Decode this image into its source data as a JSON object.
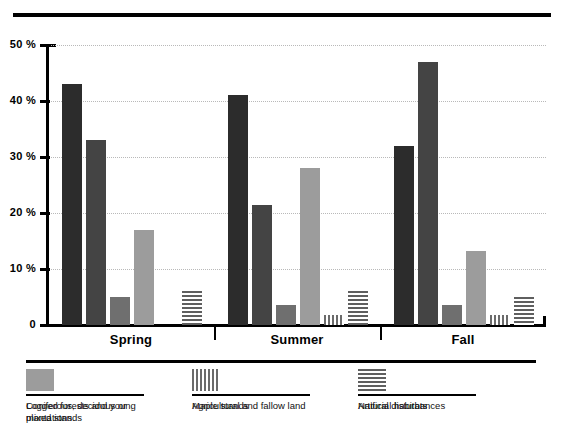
{
  "title": "",
  "chart_data": {
    "type": "bar",
    "title": "",
    "xlabel": "",
    "ylabel": "",
    "ylim": [
      0,
      50
    ],
    "yunit": "%",
    "grid": true,
    "legend_position": "bottom",
    "categories": [
      "Spring",
      "Summer",
      "Fall"
    ],
    "ytick_labels": [
      "0",
      "10 %",
      "20 %",
      "30 %",
      "40 %",
      "50 %"
    ],
    "ytick_values": [
      0,
      10,
      20,
      30,
      40,
      50
    ],
    "series": [
      {
        "name": "Coniferous, decidous or mixed stands",
        "swatch": "solid-very-dark",
        "color": "#2c2c2c",
        "values": [
          43,
          41,
          32
        ]
      },
      {
        "name": "Maple stands",
        "swatch": "solid-dark",
        "color": "#444444",
        "values": [
          33,
          21.5,
          47
        ]
      },
      {
        "name": "Natural disturbances",
        "swatch": "solid-medium-gray",
        "color": "#6f6f6f",
        "values": [
          5,
          3.5,
          3.5
        ]
      },
      {
        "name": "Logged forests and young plantations",
        "swatch": "solid-light-gray",
        "color": "#9c9c9c",
        "values": [
          17,
          28,
          13.3
        ]
      },
      {
        "name": "Agricultural and fallow land",
        "swatch": "vertical-stripes",
        "color": "#6b6b6b",
        "values": [
          0,
          1.8,
          1.8
        ]
      },
      {
        "name": "Artificial habitats",
        "swatch": "horizontal-stripes",
        "color": "#5f5f5f",
        "values": [
          6,
          6,
          5
        ]
      }
    ]
  },
  "legend": {
    "items": [
      {
        "label": "Coniferous, decidous or mixed stands"
      },
      {
        "label": "Maple stands"
      },
      {
        "label": "Natural disturbances"
      },
      {
        "label": "Logged forests and young plantations"
      },
      {
        "label": "Agricultural and fallow land"
      },
      {
        "label": "Artificial habitats"
      }
    ]
  }
}
